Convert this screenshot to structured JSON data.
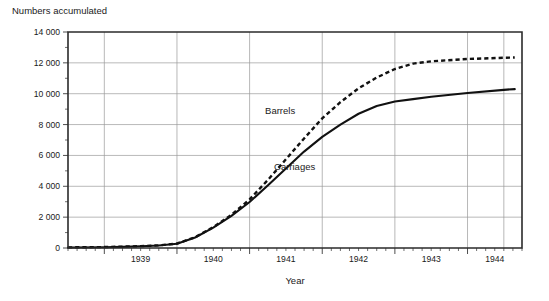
{
  "chart_data": {
    "type": "line",
    "title": "Numbers accumulated",
    "xlabel": "Year",
    "ylabel": "",
    "xlim": [
      1938.5,
      1944.75
    ],
    "ylim": [
      0,
      14000
    ],
    "grid": true,
    "legend_position": "inline-annotation",
    "y_ticks": [
      "0",
      "2 000",
      "4 000",
      "6 000",
      "8 000",
      "10 000",
      "12 000",
      "14 000"
    ],
    "y_tick_values": [
      0,
      2000,
      4000,
      6000,
      8000,
      10000,
      12000,
      14000
    ],
    "y_minor_tick_values": [
      1000,
      3000,
      5000,
      7000,
      9000,
      11000,
      13000
    ],
    "x_ticks": [
      "1939",
      "1940",
      "1941",
      "1942",
      "1943",
      "1944"
    ],
    "x_tick_values": [
      1939,
      1940,
      1941,
      1942,
      1943,
      1944
    ],
    "x_gridline_values": [
      1939,
      1940,
      1941,
      1942,
      1943,
      1944,
      1944.5
    ],
    "series": [
      {
        "name": "Barrels",
        "style": "dashed",
        "label_x": 1941.42,
        "label_y": 8700,
        "x": [
          1938.5,
          1939.0,
          1939.25,
          1939.5,
          1939.75,
          1940.0,
          1940.25,
          1940.5,
          1940.75,
          1941.0,
          1941.25,
          1941.5,
          1941.75,
          1942.0,
          1942.25,
          1942.5,
          1942.75,
          1943.0,
          1943.25,
          1943.5,
          1944.0,
          1944.5,
          1944.65
        ],
        "values": [
          40,
          60,
          90,
          120,
          170,
          290,
          700,
          1350,
          2150,
          3150,
          4400,
          5750,
          7100,
          8400,
          9450,
          10350,
          11050,
          11600,
          11950,
          12100,
          12250,
          12330,
          12350
        ]
      },
      {
        "name": "Carriages",
        "style": "solid",
        "label_x": 1941.62,
        "label_y": 5050,
        "x": [
          1938.5,
          1939.0,
          1939.25,
          1939.5,
          1939.75,
          1940.0,
          1940.25,
          1940.5,
          1940.75,
          1941.0,
          1941.25,
          1941.5,
          1941.75,
          1942.0,
          1942.25,
          1942.5,
          1942.75,
          1943.0,
          1943.25,
          1943.5,
          1944.0,
          1944.5,
          1944.65
        ],
        "values": [
          30,
          50,
          75,
          110,
          160,
          280,
          680,
          1320,
          2080,
          2980,
          4050,
          5150,
          6250,
          7200,
          8000,
          8700,
          9200,
          9500,
          9650,
          9800,
          10050,
          10250,
          10300
        ]
      }
    ]
  },
  "geometry": {
    "plot_left": 68,
    "plot_right": 522,
    "plot_top": 32,
    "plot_bottom": 248,
    "x_label_y": 284,
    "title_x": 12,
    "title_y": 14,
    "year_label_y": 262
  }
}
